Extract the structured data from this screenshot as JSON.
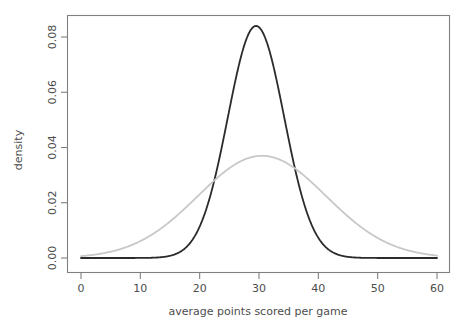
{
  "chart_data": {
    "type": "line",
    "title": "",
    "xlabel": "average points scored per game",
    "ylabel": "density",
    "xlim": [
      0,
      60
    ],
    "ylim": [
      0,
      0.088
    ],
    "grid": false,
    "legend": null,
    "xticks": [
      0,
      10,
      20,
      30,
      40,
      50,
      60
    ],
    "xtick_labels": [
      "0",
      "10",
      "20",
      "30",
      "40",
      "50",
      "60"
    ],
    "yticks": [
      0.0,
      0.02,
      0.04,
      0.06,
      0.08
    ],
    "ytick_labels": [
      "0.00",
      "0.02",
      "0.04",
      "0.06",
      "0.08"
    ],
    "series": [
      {
        "name": "narrow-distribution",
        "color": "#2b2b2b",
        "linewidth": 1.8,
        "distribution": "normal",
        "mean": 29.5,
        "sd": 4.75,
        "peak_density": 0.084,
        "peak_x": 29.5
      },
      {
        "name": "wide-distribution",
        "color": "#c8c8c8",
        "linewidth": 1.8,
        "distribution": "normal",
        "mean": 30.5,
        "sd": 10.8,
        "peak_density": 0.037,
        "peak_x": 30.5
      }
    ]
  },
  "axis_labels": {
    "x_title": "average points scored per game",
    "y_title": "density"
  },
  "colors": {
    "background": "#ffffff",
    "frame": "#808080",
    "text": "#4d4d4d",
    "series_dark": "#2b2b2b",
    "series_light": "#c8c8c8"
  }
}
